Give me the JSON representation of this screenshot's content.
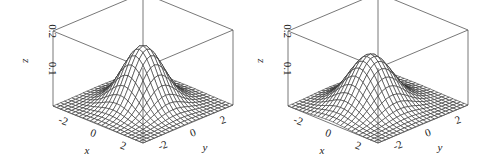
{
  "chart_data": [
    {
      "type": "surface",
      "title": "",
      "xlabel": "x",
      "ylabel": "y",
      "zlabel": "z",
      "x_range": [
        -3,
        3
      ],
      "y_range": [
        -3,
        3
      ],
      "z_range": [
        0,
        0.2
      ],
      "x_ticks": [
        "-2",
        "0",
        "2"
      ],
      "y_ticks": [
        "-2",
        "0",
        "2"
      ],
      "z_ticks": [
        "0.1",
        "0.2"
      ],
      "grid_n": 25,
      "surface": {
        "function": "bivariate normal density",
        "mu_x": 0,
        "mu_y": 0,
        "sigma_x": 1,
        "sigma_y": 1,
        "rho": 0
      },
      "peak_z": 0.159
    },
    {
      "type": "surface",
      "title": "",
      "xlabel": "x",
      "ylabel": "y",
      "zlabel": "z",
      "x_range": [
        -3,
        3
      ],
      "y_range": [
        -3,
        3
      ],
      "z_range": [
        0,
        0.2
      ],
      "x_ticks": [
        "-2",
        "0",
        "2"
      ],
      "y_ticks": [
        "-2",
        "0",
        "2"
      ],
      "z_ticks": [
        "0.1",
        "0.2"
      ],
      "grid_n": 25,
      "surface": {
        "function": "bivariate normal density (estimate)",
        "mu_x": -0.2,
        "mu_y": -0.3,
        "sigma_x": 1.05,
        "sigma_y": 1.1,
        "rho": 0
      },
      "peak_z": 0.138
    }
  ],
  "panels": [
    {
      "z_label": "z",
      "x_label": "x",
      "y_label": "y",
      "z_tick_1": "0.1",
      "z_tick_2": "0.2",
      "x_tick_a": "-2",
      "x_tick_b": "0",
      "x_tick_c": "2",
      "y_tick_a": "-2",
      "y_tick_b": "0",
      "y_tick_c": "2"
    },
    {
      "z_label": "z",
      "x_label": "x",
      "y_label": "y",
      "z_tick_1": "0.1",
      "z_tick_2": "0.2",
      "x_tick_a": "-2",
      "x_tick_b": "0",
      "x_tick_c": "2",
      "y_tick_a": "-2",
      "y_tick_b": "0",
      "y_tick_c": "2"
    }
  ]
}
